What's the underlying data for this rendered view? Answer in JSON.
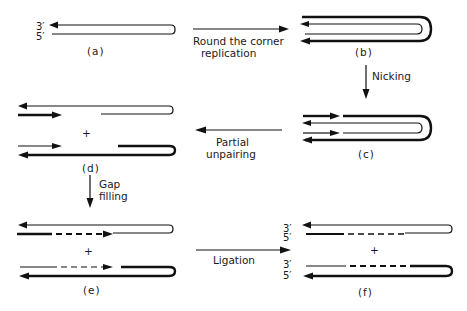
{
  "figure": {
    "panels": [
      {
        "id": "a",
        "caption": "(a)",
        "ends": {
          "top": "3′",
          "bottom": "5′"
        }
      },
      {
        "id": "b",
        "caption": "(b)"
      },
      {
        "id": "c",
        "caption": "(c)"
      },
      {
        "id": "d",
        "caption": "(d)",
        "join": "+"
      },
      {
        "id": "e",
        "caption": "(e)",
        "join": "+"
      },
      {
        "id": "f",
        "caption": "(f)",
        "join": "+",
        "ends_top": {
          "top": "3′",
          "bottom": "5′"
        },
        "ends_bottom": {
          "top": "3′",
          "bottom": "5′"
        }
      }
    ],
    "steps": [
      {
        "from": "a",
        "to": "b",
        "label_line1": "Round the corner",
        "label_line2": "replication"
      },
      {
        "from": "b",
        "to": "c",
        "label_line1": "Nicking",
        "label_line2": ""
      },
      {
        "from": "c",
        "to": "d",
        "label_line1": "Partial",
        "label_line2": "unpairing"
      },
      {
        "from": "d",
        "to": "e",
        "label_line1": "Gap",
        "label_line2": "filling"
      },
      {
        "from": "e",
        "to": "f",
        "label_line1": "Ligation",
        "label_line2": ""
      }
    ]
  }
}
